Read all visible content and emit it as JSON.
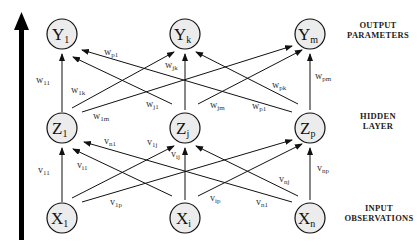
{
  "diagram": {
    "type": "neural-network",
    "direction_arrow": "upward",
    "layers": [
      {
        "id": "output",
        "label_line1": "OUTPUT",
        "label_line2": "PARAMETERS",
        "nodes": [
          {
            "id": "Y1",
            "base": "Y",
            "sub": "1"
          },
          {
            "id": "Yk",
            "base": "Y",
            "sub": "k"
          },
          {
            "id": "Ym",
            "base": "Y",
            "sub": "m"
          }
        ]
      },
      {
        "id": "hidden",
        "label_line1": "HIDDEN",
        "label_line2": "LAYER",
        "nodes": [
          {
            "id": "Z1",
            "base": "Z",
            "sub": "1"
          },
          {
            "id": "Zj",
            "base": "Z",
            "sub": "j"
          },
          {
            "id": "Zp",
            "base": "Z",
            "sub": "p"
          }
        ]
      },
      {
        "id": "input",
        "label_line1": "INPUT",
        "label_line2": "OBSERVATIONS",
        "nodes": [
          {
            "id": "X1",
            "base": "X",
            "sub": "1"
          },
          {
            "id": "Xi",
            "base": "X",
            "sub": "i"
          },
          {
            "id": "Xn",
            "base": "X",
            "sub": "n"
          }
        ]
      }
    ],
    "hidden_to_output_weights": [
      {
        "from": "Z1",
        "to": "Y1",
        "base": "w",
        "sub": "11"
      },
      {
        "from": "Z1",
        "to": "Yk",
        "base": "w",
        "sub": "1k"
      },
      {
        "from": "Z1",
        "to": "Ym",
        "base": "w",
        "sub": "1m"
      },
      {
        "from": "Zj",
        "to": "Y1",
        "base": "w",
        "sub": "j1"
      },
      {
        "from": "Zj",
        "to": "Yk",
        "base": "w",
        "sub": "jk"
      },
      {
        "from": "Zj",
        "to": "Ym",
        "base": "w",
        "sub": "jm"
      },
      {
        "from": "Zp",
        "to": "Y1",
        "base": "w",
        "sub": "p1"
      },
      {
        "from": "Zp",
        "to": "Yk",
        "base": "w",
        "sub": "pk"
      },
      {
        "from": "Zp",
        "to": "Ym",
        "base": "w",
        "sub": "pm"
      }
    ],
    "input_to_hidden_weights": [
      {
        "from": "X1",
        "to": "Z1",
        "base": "v",
        "sub": "11"
      },
      {
        "from": "X1",
        "to": "Zj",
        "base": "v",
        "sub": "1j"
      },
      {
        "from": "X1",
        "to": "Zp",
        "base": "v",
        "sub": "1p"
      },
      {
        "from": "Xi",
        "to": "Z1",
        "base": "v",
        "sub": "i1"
      },
      {
        "from": "Xi",
        "to": "Zj",
        "base": "v",
        "sub": "ij"
      },
      {
        "from": "Xi",
        "to": "Zp",
        "base": "v",
        "sub": "ip"
      },
      {
        "from": "Xn",
        "to": "Z1",
        "base": "v",
        "sub": "n1"
      },
      {
        "from": "Xn",
        "to": "Zj",
        "base": "v",
        "sub": "nj"
      },
      {
        "from": "Xn",
        "to": "Zp",
        "base": "v",
        "sub": "np"
      }
    ],
    "upper_p1_label": {
      "base": "w",
      "sub": "p1"
    },
    "colors": {
      "node_fill": "#ececec",
      "stroke": "#111111",
      "background": "#ffffff"
    }
  }
}
